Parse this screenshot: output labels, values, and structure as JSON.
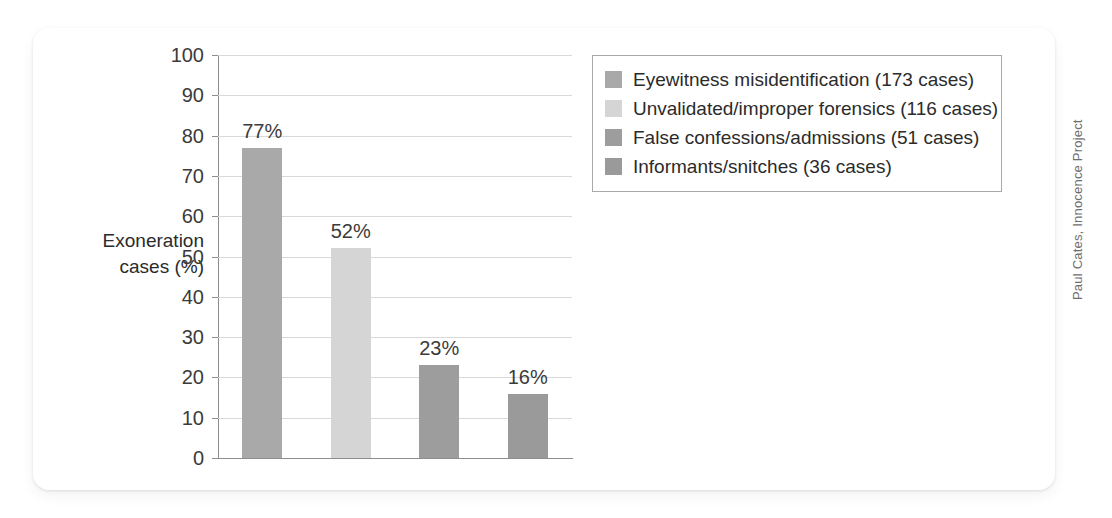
{
  "credit": "Paul Cates, Innocence Project",
  "axis": {
    "y_title_line1": "Exoneration",
    "y_title_line2": "cases (%)"
  },
  "chart_data": {
    "type": "bar",
    "title": "",
    "xlabel": "",
    "ylabel": "Exoneration cases (%)",
    "ylim": [
      0,
      100
    ],
    "ytick_step": 10,
    "yticks": [
      100,
      90,
      80,
      70,
      60,
      50,
      40,
      30,
      20,
      10,
      0
    ],
    "ytick_labels": [
      "100",
      "90",
      "80",
      "70",
      "60",
      "50",
      "40",
      "30",
      "20",
      "10",
      "0"
    ],
    "grid": true,
    "grid_axis": "y",
    "legend_position": "upper right outside",
    "categories": [
      "Eyewitness misidentification",
      "Unvalidated/improper forensics",
      "False confessions/admissions",
      "Informants/snitches"
    ],
    "values": [
      77,
      52,
      23,
      16
    ],
    "data_labels": [
      "77%",
      "52%",
      "23%",
      "16%"
    ],
    "cases": [
      173,
      116,
      51,
      36
    ],
    "colors": [
      "#a9a9a9",
      "#d5d5d5",
      "#9d9d9d",
      "#9a9a9a"
    ],
    "legend_entries": [
      "Eyewitness misidentification (173 cases)",
      "Unvalidated/improper forensics (116 cases)",
      "False confessions/admissions (51 cases)",
      "Informants/snitches (36 cases)"
    ]
  }
}
